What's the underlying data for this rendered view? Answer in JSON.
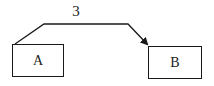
{
  "diagram": {
    "nodes": [
      {
        "id": "A",
        "label": "A",
        "x": 12,
        "y": 44,
        "w": 52,
        "h": 33
      },
      {
        "id": "B",
        "label": "B",
        "x": 148,
        "y": 46,
        "w": 54,
        "h": 33
      }
    ],
    "edges": [
      {
        "from": "A",
        "to": "B",
        "label": "3",
        "directed": true
      }
    ],
    "colors": {
      "stroke": "#1a1a1a",
      "background": "#ffffff"
    }
  }
}
